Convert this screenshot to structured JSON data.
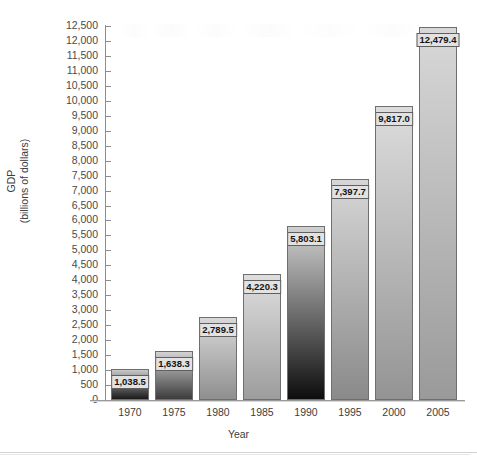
{
  "chart_data": {
    "type": "bar",
    "title": "",
    "xlabel": "Year",
    "ylabel": "GDP\n(billions of dollars)",
    "ylabel_line1": "GDP",
    "ylabel_line2": "(billions of dollars)",
    "categories": [
      "1970",
      "1975",
      "1980",
      "1985",
      "1990",
      "1995",
      "2000",
      "2005"
    ],
    "values": [
      1038.5,
      1638.3,
      2789.5,
      4220.3,
      5803.1,
      7397.7,
      9817.0,
      12479.4
    ],
    "value_labels": [
      "1,038.5",
      "1,638.3",
      "2,789.5",
      "4,220.3",
      "5,803.1",
      "7,397.7",
      "9,817.0",
      "12,479.4"
    ],
    "ylim": [
      0,
      12500
    ],
    "ytick_step": 500,
    "ytick_labels": [
      "12,500",
      "12,000",
      "11,500",
      "11,000",
      "10,500",
      "10,000",
      "9,500",
      "9,000",
      "8,500",
      "8,000",
      "7,500",
      "7,000",
      "6,500",
      "6,000",
      "5,500",
      "5,000",
      "4,500",
      "4,000",
      "3,500",
      "3,000",
      "2,500",
      "2,000",
      "1,500",
      "1,000",
      "500",
      "0"
    ],
    "ytick_values": [
      12500,
      12000,
      11500,
      11000,
      10500,
      10000,
      9500,
      9000,
      8500,
      8000,
      7500,
      7000,
      6500,
      6000,
      5500,
      5000,
      4500,
      4000,
      3500,
      3000,
      2500,
      2000,
      1500,
      1000,
      500,
      0
    ],
    "grid": false,
    "legend": "none",
    "bar_styles": [
      {
        "category": "1970",
        "top_color": "#c8c8c8",
        "bottom_color": "#1a1a1a"
      },
      {
        "category": "1975",
        "top_color": "#d2d2d2",
        "bottom_color": "#3c3c3c"
      },
      {
        "category": "1980",
        "top_color": "#d8d8d8",
        "bottom_color": "#8f8f8f"
      },
      {
        "category": "1985",
        "top_color": "#dedede",
        "bottom_color": "#9d9d9d"
      },
      {
        "category": "1990",
        "top_color": "#d0d0d0",
        "bottom_color": "#0d0d0d"
      },
      {
        "category": "1995",
        "top_color": "#d6d6d6",
        "bottom_color": "#8a8a8a"
      },
      {
        "category": "2000",
        "top_color": "#dcdcdc",
        "bottom_color": "#949494"
      },
      {
        "category": "2005",
        "top_color": "#d8d8d8",
        "bottom_color": "#9a9a9a"
      }
    ]
  },
  "axis": {
    "x_title": "Year",
    "y_title_line1": "GDP",
    "y_title_line2": "(billions of dollars)"
  },
  "colors": {
    "axis": "#8d8d8d",
    "text": "#3d3d3d",
    "label_bg": "#e2e2e2",
    "label_border": "#5f5f5f",
    "bar_border": "#6f6f6f",
    "background": "#ffffff"
  }
}
